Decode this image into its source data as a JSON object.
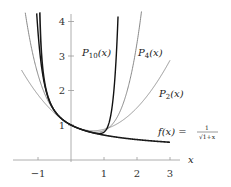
{
  "chart_data": {
    "type": "line",
    "title": "",
    "xlabel": "x",
    "ylabel": "",
    "xlim": [
      -1.7,
      3.3
    ],
    "ylim": [
      0,
      4.3
    ],
    "grid": false,
    "x_ticks": [
      -1,
      1,
      2,
      3
    ],
    "y_ticks": [
      1,
      2,
      3,
      4
    ],
    "x_tick_labels": [
      "−1",
      "1",
      "2",
      "3"
    ],
    "y_tick_labels": [
      "1",
      "2",
      "3",
      "4"
    ],
    "series": [
      {
        "name": "f(x) = 1/√(1+x)",
        "label": "f(x) =",
        "color": "#1a1a1a",
        "width": 1.6,
        "x": [
          -0.95,
          -0.9,
          -0.8,
          -0.6,
          -0.4,
          -0.2,
          0,
          0.5,
          1,
          1.5,
          2,
          2.5,
          3
        ],
        "values": [
          4.47,
          3.16,
          2.24,
          1.58,
          1.29,
          1.12,
          1.0,
          0.82,
          0.71,
          0.63,
          0.58,
          0.53,
          0.5
        ]
      },
      {
        "name": "P2(x)",
        "label": "P",
        "sub": "2",
        "color": "#8a8a8a",
        "width": 0.9,
        "x": [
          -1.5,
          -1,
          -0.5,
          0,
          0.5,
          1,
          1.5,
          2,
          2.5,
          3
        ],
        "values": [
          2.59,
          1.88,
          1.34,
          1.0,
          0.84,
          0.88,
          1.09,
          1.5,
          2.09,
          2.88
        ]
      },
      {
        "name": "P4(x)",
        "label": "P",
        "sub": "4",
        "color": "#7a7a7a",
        "width": 0.9,
        "x": [
          -1.3,
          -1,
          -0.5,
          0,
          0.5,
          1,
          1.5,
          2
        ],
        "values": [
          4.3,
          2.46,
          1.39,
          1.0,
          0.82,
          0.84,
          1.62,
          4.09
        ]
      },
      {
        "name": "P10(x)",
        "label": "P",
        "sub": "10",
        "color": "#111111",
        "width": 1.4,
        "x": [
          -1.05,
          -1,
          -0.5,
          0,
          0.5,
          1,
          1.2,
          1.4
        ],
        "values": [
          4.3,
          3.7,
          1.41,
          1.0,
          0.82,
          0.79,
          1.5,
          4.3
        ]
      }
    ],
    "annotations": [
      {
        "text": "P10(x)",
        "x": 0.35,
        "y": 3.1
      },
      {
        "text": "P4(x)",
        "x": 2.0,
        "y": 3.1
      },
      {
        "text": "P2(x)",
        "x": 2.6,
        "y": 1.9
      },
      {
        "text": "f(x) = 1/√(1+x)",
        "x": 2.6,
        "y": 0.8
      }
    ],
    "coefficients": [
      1,
      -0.5,
      0.375,
      -0.3125,
      0.2734375,
      -0.24609375,
      0.2255859375,
      -0.20947265625,
      0.196380615234375,
      -0.1854705810546875,
      0.17619705200195312
    ]
  },
  "labels": {
    "x_axis": "x",
    "f_lhs": "f(x) =",
    "f_num": "1",
    "f_den": "√1+x",
    "p10_main": "P",
    "p10_sub": "10",
    "p10_arg": "(x)",
    "p4_main": "P",
    "p4_sub": "4",
    "p4_arg": "(x)",
    "p2_main": "P",
    "p2_sub": "2",
    "p2_arg": "(x)"
  }
}
